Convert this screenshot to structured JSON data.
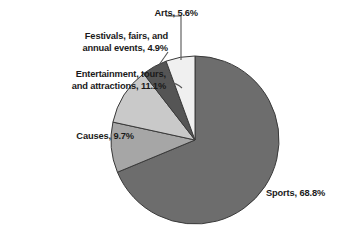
{
  "chart_data": {
    "type": "pie",
    "title": "",
    "subtitle": "",
    "xlabel": "",
    "ylabel": "",
    "legend_position": "none",
    "grid": false,
    "label_format": "{category}, {value}%",
    "start_angle_deg": 0,
    "direction": "clockwise",
    "categories": [
      "Sports",
      "Causes",
      "Entertainment, tours, and attractions",
      "Festivals, fairs, and annual events",
      "Arts"
    ],
    "values": [
      68.8,
      9.7,
      11.1,
      4.9,
      5.6
    ],
    "colors": [
      "#6d6d6d",
      "#a6a6a6",
      "#c9c9c9",
      "#555555",
      "#f0f0f0"
    ],
    "slices": [
      {
        "category": "Sports",
        "value": 68.8,
        "label": "Sports, 68.8%",
        "color": "#6d6d6d",
        "label_position": "right"
      },
      {
        "category": "Causes",
        "value": 9.7,
        "label": "Causes, 9.7%",
        "color": "#a6a6a6",
        "label_position": "left"
      },
      {
        "category": "Entertainment, tours, and attractions",
        "value": 11.1,
        "label_line1": "Entertainment, tours,",
        "label_line2": "and attractions, 11.1%",
        "label": "Entertainment, tours, and attractions, 11.1%",
        "color": "#c9c9c9",
        "label_position": "left"
      },
      {
        "category": "Festivals, fairs, and annual events",
        "value": 4.9,
        "label_line1": "Festivals, fairs, and",
        "label_line2": "annual events, 4.9%",
        "label": "Festivals, fairs, and annual events, 4.9%",
        "color": "#555555",
        "label_position": "upper-left"
      },
      {
        "category": "Arts",
        "value": 5.6,
        "label": "Arts, 5.6%",
        "color": "#f0f0f0",
        "label_position": "top"
      }
    ],
    "total": 100.1,
    "units": "percent"
  },
  "figure": {
    "background_color": "#ffffff",
    "outline_color": "#3a3a3a",
    "text_color": "#1a1a1a",
    "leader_line_color": "#555555"
  }
}
